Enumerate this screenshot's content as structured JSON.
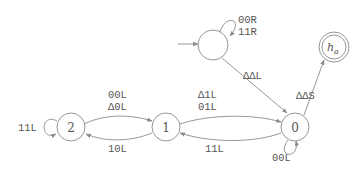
{
  "diagram": {
    "type": "turing-machine-state-diagram",
    "states": [
      {
        "id": "start",
        "label": ""
      },
      {
        "id": "halt",
        "label": "h",
        "subscript": "a"
      },
      {
        "id": "q0",
        "label": "0"
      },
      {
        "id": "q1",
        "label": "1"
      },
      {
        "id": "q2",
        "label": "2"
      }
    ],
    "transitions": {
      "start_loop": {
        "lines": [
          "00R",
          "11R"
        ]
      },
      "start_to_0": {
        "label": "ΔΔL"
      },
      "q0_to_halt": {
        "label": "ΔΔS"
      },
      "q0_loop": {
        "label": "00L"
      },
      "q0_to_1": {
        "lines": [
          "Δ1L",
          "01L"
        ]
      },
      "q1_to_0": {
        "label": "11L"
      },
      "q1_to_2": {
        "label": "10L"
      },
      "q2_to_1": {
        "lines": [
          "00L",
          "Δ0L"
        ]
      },
      "q2_loop": {
        "label": "11L"
      }
    }
  }
}
